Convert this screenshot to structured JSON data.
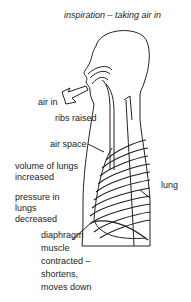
{
  "title": "inspiration – taking air in",
  "labels": {
    "air_in": "air in",
    "ribs_raised": "ribs raised",
    "air_space": "air space",
    "volume_line1": "volume of lungs",
    "volume_line2": "increased",
    "pressure_line1": "pressure in",
    "pressure_line2": "lungs",
    "pressure_line3": "decreased",
    "lung": "lung",
    "diaphragm_line1": "diaphragm",
    "diaphragm_line2": "muscle",
    "diaphragm_line3": "contracted –",
    "diaphragm_line4": "shortens,",
    "diaphragm_line5": "moves down"
  },
  "colors": {
    "ink": "#222222",
    "background": "#ffffff"
  }
}
